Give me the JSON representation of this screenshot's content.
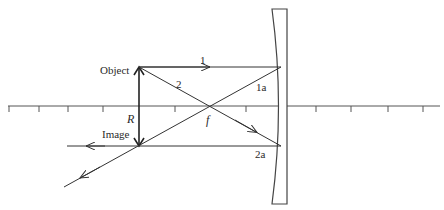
{
  "diagram": {
    "type": "ray-diagram",
    "labels": {
      "object": "Object",
      "image": "Image",
      "ray1": "1",
      "ray1_reflected": "1a",
      "ray2": "2",
      "ray2_reflected": "2a",
      "focal_point": "f",
      "center_of_curvature": "R"
    },
    "colors": {
      "line": "#333333",
      "mirror": "#444444",
      "background": "#ffffff"
    },
    "principal_axis": {
      "y": 106,
      "x_start": 8,
      "x_end": 440,
      "tick_x": [
        9,
        39,
        68,
        103,
        175,
        246,
        316,
        351,
        388,
        423
      ]
    }
  }
}
